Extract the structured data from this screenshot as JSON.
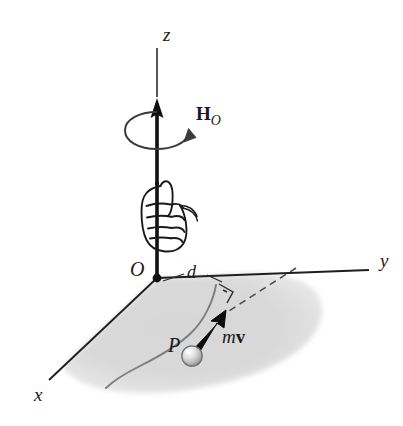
{
  "figure": {
    "background_color": "#ffffff",
    "width": 403,
    "height": 426
  },
  "axes": {
    "z": {
      "label": "z",
      "x": 163,
      "y": 24
    },
    "y": {
      "label": "y",
      "x": 380,
      "y": 250
    },
    "x": {
      "label": "x",
      "x": 34,
      "y": 384
    }
  },
  "origin": {
    "label": "O",
    "x": 130,
    "y": 258
  },
  "particle": {
    "label": "P",
    "x": 168,
    "y": 334
  },
  "momentum_vector": {
    "label_m": "m",
    "label_v": "v",
    "x": 222,
    "y": 326
  },
  "angular_momentum": {
    "label_H": "H",
    "label_sub": "O",
    "x": 196,
    "y": 103
  },
  "moment_arm": {
    "label": "d",
    "x": 187,
    "y": 267
  },
  "colors": {
    "stroke": "#1a1a1a",
    "plane_fill": "#d8d8d8",
    "path_stroke": "#8a8a8a",
    "sphere_light": "#f2f2f2",
    "sphere_dark": "#9a9a9a",
    "dashed_stroke": "#555555"
  },
  "icon_names": {
    "hand": "right-hand-grip-icon",
    "rotation": "rotation-arrow-icon",
    "right_angle": "right-angle-mark-icon",
    "particle_sphere": "particle-sphere-icon"
  }
}
